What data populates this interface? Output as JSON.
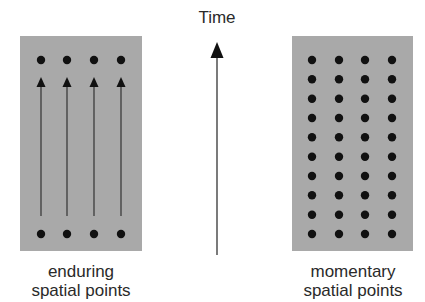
{
  "time_axis": {
    "label": "Time",
    "direction": "up"
  },
  "left_diagram": {
    "caption_line1": "enduring",
    "caption_line2": "spatial points",
    "columns": 4,
    "rows_of_dots": 2,
    "has_arrows": true,
    "description": "4 points at bottom connected by upward arrows to 4 points at top"
  },
  "right_diagram": {
    "caption_line1": "momentary",
    "caption_line2": "spatial points",
    "columns": 4,
    "rows_of_dots": 10,
    "has_arrows": false,
    "description": "4x10 grid of discrete points, no connecting arrows"
  },
  "colors": {
    "panel_fill": "#a9a9a9",
    "dot": "#111111",
    "arrow": "#1a1a1a",
    "text": "#2a2a2a"
  }
}
